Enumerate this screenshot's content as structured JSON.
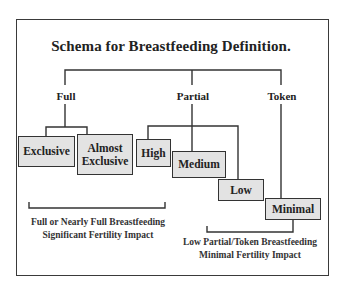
{
  "diagram": {
    "title": "Schema for Breastfeeding Definition.",
    "categories": [
      {
        "label": "Full"
      },
      {
        "label": "Partial"
      },
      {
        "label": "Token"
      }
    ],
    "boxes": [
      {
        "label": "Exclusive",
        "parent": "Full"
      },
      {
        "label": "Almost Exclusive",
        "parent": "Full"
      },
      {
        "label": "High",
        "parent": "Partial"
      },
      {
        "label": "Medium",
        "parent": "Partial"
      },
      {
        "label": "Low",
        "parent": "Partial"
      },
      {
        "label": "Minimal",
        "parent": "Token"
      }
    ],
    "groups": [
      {
        "line1": "Full or Nearly Full Breastfeeding",
        "line2": "Significant Fertility Impact"
      },
      {
        "line1": "Low Partial/Token Breastfeeding",
        "line2": "Minimal Fertility Impact"
      }
    ],
    "colors": {
      "box_fill": "#e3e3e3",
      "line": "#333333",
      "border": "#3a3a3a"
    }
  }
}
